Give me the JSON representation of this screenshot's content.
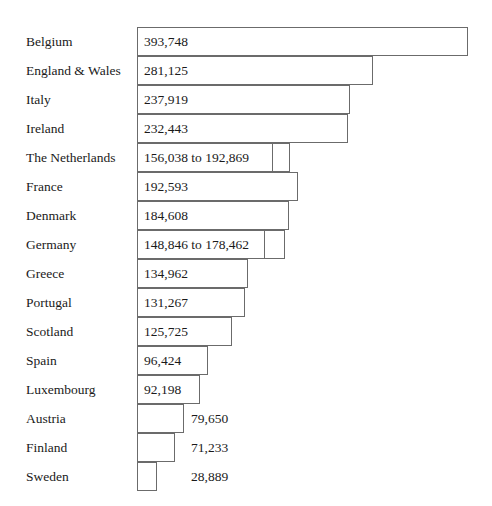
{
  "chart_data": {
    "type": "bar",
    "orientation": "horizontal",
    "title": "",
    "subtitle": "",
    "xlabel": "",
    "ylabel": "",
    "grid": false,
    "legend": null,
    "axis_visible": false,
    "xlim": [
      0,
      393748
    ],
    "categories": [
      "Belgium",
      "England & Wales",
      "Italy",
      "Ireland",
      "The Netherlands",
      "France",
      "Denmark",
      "Germany",
      "Greece",
      "Portugal",
      "Scotland",
      "Spain",
      "Luxembourg",
      "Austria",
      "Finland",
      "Sweden"
    ],
    "values": [
      393748,
      281125,
      237919,
      232443,
      156038,
      192593,
      184608,
      148846,
      134962,
      131267,
      125725,
      96424,
      92198,
      79650,
      71233,
      28889
    ],
    "value_ranges": {
      "The Netherlands": [
        156038,
        192869
      ],
      "Germany": [
        148846,
        178462
      ]
    },
    "bars": [
      {
        "category": "Belgium",
        "value": 393748,
        "value_label": "393,748",
        "label_position": "inside",
        "range": false,
        "bar_end_px": 468
      },
      {
        "category": "England & Wales",
        "value": 281125,
        "value_label": "281,125",
        "label_position": "inside",
        "range": false,
        "bar_end_px": 373
      },
      {
        "category": "Italy",
        "value": 237919,
        "value_label": "237,919",
        "label_position": "inside",
        "range": false,
        "bar_end_px": 350
      },
      {
        "category": "Ireland",
        "value": 232443,
        "value_label": "232,443",
        "label_position": "inside",
        "range": false,
        "bar_end_px": 348
      },
      {
        "category": "The Netherlands",
        "value": 156038,
        "value_high": 192869,
        "value_label": "156,038 to 192,869",
        "label_position": "inside",
        "range": true,
        "bar_end_px": 273,
        "range_end_px": 290
      },
      {
        "category": "France",
        "value": 192593,
        "value_label": "192,593",
        "label_position": "inside",
        "range": false,
        "bar_end_px": 298
      },
      {
        "category": "Denmark",
        "value": 184608,
        "value_label": "184,608",
        "label_position": "inside",
        "range": false,
        "bar_end_px": 289
      },
      {
        "category": "Germany",
        "value": 148846,
        "value_high": 178462,
        "value_label": "148,846 to 178,462",
        "label_position": "inside",
        "range": true,
        "bar_end_px": 265,
        "range_end_px": 285
      },
      {
        "category": "Greece",
        "value": 134962,
        "value_label": "134,962",
        "label_position": "inside",
        "range": false,
        "bar_end_px": 248
      },
      {
        "category": "Portugal",
        "value": 131267,
        "value_label": "131,267",
        "label_position": "inside",
        "range": false,
        "bar_end_px": 245
      },
      {
        "category": "Scotland",
        "value": 125725,
        "value_label": "125,725",
        "label_position": "inside",
        "range": false,
        "bar_end_px": 232
      },
      {
        "category": "Spain",
        "value": 96424,
        "value_label": "96,424",
        "label_position": "inside",
        "range": false,
        "bar_end_px": 208
      },
      {
        "category": "Luxembourg",
        "value": 92198,
        "value_label": "92,198",
        "label_position": "inside",
        "range": false,
        "bar_end_px": 200
      },
      {
        "category": "Austria",
        "value": 79650,
        "value_label": "79,650",
        "label_position": "outside",
        "range": false,
        "bar_end_px": 184
      },
      {
        "category": "Finland",
        "value": 71233,
        "value_label": "71,233",
        "label_position": "outside",
        "range": false,
        "bar_end_px": 175
      },
      {
        "category": "Sweden",
        "value": 28889,
        "value_label": "28,889",
        "label_position": "outside",
        "range": false,
        "bar_end_px": 157
      }
    ],
    "colors": {
      "bar_fill": "#ffffff",
      "bar_border": "#6b6b6b",
      "text": "#1a1a1a",
      "background": "#ffffff"
    }
  },
  "layout": {
    "bar_origin_x": 137,
    "row_height": 29,
    "first_row_top": 27,
    "label_left": 26,
    "outside_label_left": 191
  }
}
